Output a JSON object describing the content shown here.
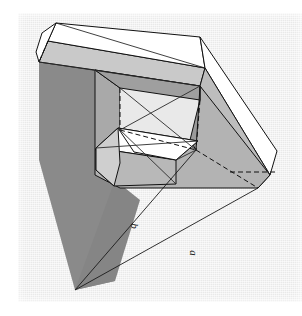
{
  "page": {
    "folio": "270",
    "background_color": "#ffffff",
    "plate_color": "#e9e9e9"
  },
  "figure": {
    "name": "impossible-spiral-frame",
    "type": "3d-line-drawing",
    "orientation_deg": 90,
    "labels": [
      {
        "id": "a",
        "text": "a",
        "x": 190,
        "y": 253,
        "rotation": 90
      },
      {
        "id": "b",
        "text": "b",
        "x": 131,
        "y": 226,
        "rotation": 90
      }
    ],
    "colors": {
      "outline": "#111111",
      "face_top_light": "#ffffff",
      "face_mid_gray": "#b4b4b4",
      "face_dark_gray": "#8f8f8f",
      "face_shadow": "#7a7a7a",
      "hidden_edge": "#111111"
    }
  }
}
